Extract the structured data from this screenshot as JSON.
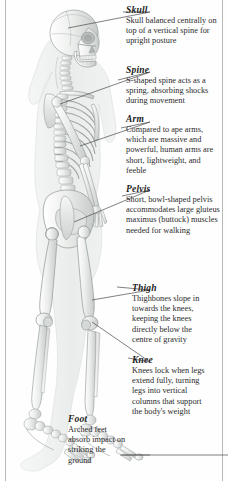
{
  "page": {
    "background_color": "#fefefe",
    "rule_color": "#b9b9b9",
    "text_color": "#2b2b2b",
    "heading_color": "#1d1d1d",
    "leader_color": "#4a4a4a"
  },
  "figure": {
    "name": "walking-skeleton-illustration",
    "palette": {
      "bone_light": "#f2f2f0",
      "bone_mid": "#d8dad8",
      "bone_shadow": "#b4b8b6",
      "body_ghost": "#e8eaea",
      "outline": "#9aa0a0"
    }
  },
  "callouts": [
    {
      "id": "skull",
      "heading": "Skull",
      "body": "Skull balanced centrally on top of a vertical spine for upright posture"
    },
    {
      "id": "spine",
      "heading": "Spine",
      "body": "S-shaped spine acts as a spring, absorbing shocks during movement"
    },
    {
      "id": "arm",
      "heading": "Arm",
      "body": "Compared to ape arms, which are massive and powerful, human arms are short, lightweight, and feeble"
    },
    {
      "id": "pelvis",
      "heading": "Pelvis",
      "body": "Short, bowl-shaped pelvis accommodates large gluteus maximus (buttock) muscles needed for walking"
    },
    {
      "id": "thigh",
      "heading": "Thigh",
      "body": "Thighbones slope in towards the knees, keeping the knees directly below the centre of gravity"
    },
    {
      "id": "knee",
      "heading": "Knee",
      "body": "Knees lock when legs extend fully, turning legs into vertical columns that support the body's weight"
    },
    {
      "id": "foot",
      "heading": "Foot",
      "body": "Arched feet absorb impact on striking the ground"
    }
  ]
}
